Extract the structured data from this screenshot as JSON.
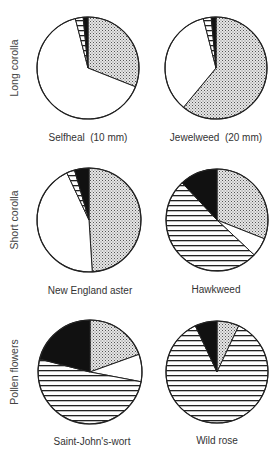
{
  "chart_data": [
    {
      "type": "pie",
      "group": "Long corolla",
      "title": "Selfheal (10 mm)",
      "slices": [
        {
          "pattern": "dotted",
          "value": 31
        },
        {
          "pattern": "white",
          "value": 65
        },
        {
          "pattern": "striped",
          "value": 2.5
        },
        {
          "pattern": "black",
          "value": 1.5
        }
      ]
    },
    {
      "type": "pie",
      "group": "Long corolla",
      "title": "Jewelweed (20 mm)",
      "slices": [
        {
          "pattern": "dotted",
          "value": 61
        },
        {
          "pattern": "white",
          "value": 35
        },
        {
          "pattern": "striped",
          "value": 2.5
        },
        {
          "pattern": "black",
          "value": 1.5
        }
      ]
    },
    {
      "type": "pie",
      "group": "Short corolla",
      "title": "New England aster",
      "slices": [
        {
          "pattern": "dotted",
          "value": 49
        },
        {
          "pattern": "white",
          "value": 44
        },
        {
          "pattern": "striped",
          "value": 2.5
        },
        {
          "pattern": "black",
          "value": 4.5
        }
      ]
    },
    {
      "type": "pie",
      "group": "Short corolla",
      "title": "Hawkweed",
      "slices": [
        {
          "pattern": "dotted",
          "value": 31
        },
        {
          "pattern": "white",
          "value": 6
        },
        {
          "pattern": "striped",
          "value": 51
        },
        {
          "pattern": "black",
          "value": 12
        }
      ]
    },
    {
      "type": "pie",
      "group": "Pollen flowers",
      "title": "Saint-John's-wort",
      "slices": [
        {
          "pattern": "dotted",
          "value": 19.5
        },
        {
          "pattern": "white",
          "value": 8.5
        },
        {
          "pattern": "striped",
          "value": 51
        },
        {
          "pattern": "black",
          "value": 21
        }
      ]
    },
    {
      "type": "pie",
      "group": "Pollen flowers",
      "title": "Wild rose",
      "slices": [
        {
          "pattern": "dotted",
          "value": 7
        },
        {
          "pattern": "white",
          "value": 0
        },
        {
          "pattern": "striped",
          "value": 86
        },
        {
          "pattern": "black",
          "value": 7
        }
      ]
    }
  ],
  "row_labels": [
    "Long corolla",
    "Short corolla",
    "Pollen flowers"
  ],
  "pie_titles": [
    "Selfheal  (10 mm)",
    "Jewelweed  (20 mm)",
    "New England aster",
    "Hawkweed",
    "Saint-John's-wort",
    "Wild rose"
  ],
  "colors": {
    "outline": "#222222",
    "black": "#111111",
    "dot": "#555555",
    "stripe": "#222222",
    "white": "#ffffff"
  }
}
